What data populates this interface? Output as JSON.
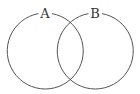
{
  "diagram": {
    "type": "venn",
    "sets": [
      {
        "label": "A",
        "cx": 45,
        "cy": 51,
        "r": 38
      },
      {
        "label": "B",
        "cx": 95,
        "cy": 51,
        "r": 38
      }
    ],
    "stroke_color": "#555555",
    "background": "#ffffff"
  }
}
